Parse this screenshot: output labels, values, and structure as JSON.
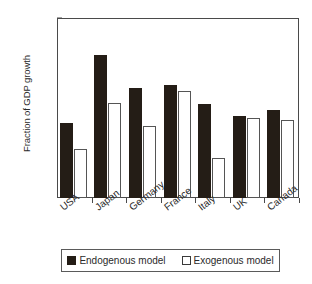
{
  "chart_data": {
    "type": "bar",
    "title": "",
    "subtitle": "",
    "xlabel": "",
    "ylabel": "Fraction of GDP growth",
    "categories": [
      "USA",
      "Japan",
      "Germany",
      "France",
      "Italy",
      "UK",
      "Canada"
    ],
    "series": [
      {
        "name": "Endogenous model",
        "color": "#241d16",
        "style": "filled",
        "values": [
          0.333,
          0.635,
          0.489,
          0.502,
          0.418,
          0.365,
          0.391
        ]
      },
      {
        "name": "Exogenous model",
        "color": "#ffffff",
        "style": "hollow",
        "values": [
          0.218,
          0.422,
          0.32,
          0.475,
          0.178,
          0.356,
          0.347
        ]
      }
    ],
    "ylim": [
      0,
      0.8
    ],
    "yticks": [
      0,
      0.2,
      0.4,
      0.6,
      0.8
    ],
    "ytick_labels": [
      "0",
      "0.2",
      "0.4",
      "0.6",
      "0.8"
    ],
    "grid": false,
    "legend_position": "bottom-outside",
    "frame": true
  },
  "legend": {
    "entries": [
      {
        "label": "Endogenous model",
        "swatch": "filled-square"
      },
      {
        "label": "Exogenous model",
        "swatch": "hollow-square"
      }
    ]
  }
}
